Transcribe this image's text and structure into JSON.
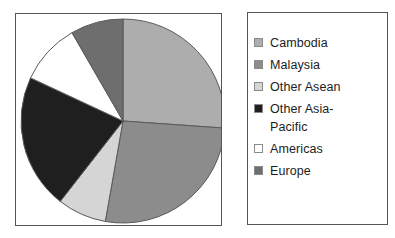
{
  "chart_data": {
    "type": "pie",
    "title": "",
    "subtitle": "",
    "xlabel": "",
    "ylabel": "",
    "grid": false,
    "legend_position": "right",
    "start_angle_deg": 0,
    "direction": "clockwise",
    "categories": [
      "Cambodia",
      "Malaysia",
      "Other Asean",
      "Other Asia-Pacific",
      "Americas",
      "Europe"
    ],
    "values": [
      26,
      27,
      8,
      21,
      10,
      8
    ],
    "slices": [
      {
        "label": "Cambodia",
        "value": 26,
        "percent": 26,
        "color": "#adadad",
        "start_angle_deg": 0,
        "end_angle_deg": 94
      },
      {
        "label": "Malaysia",
        "value": 27,
        "percent": 27,
        "color": "#8c8c8c",
        "start_angle_deg": 94,
        "end_angle_deg": 190
      },
      {
        "label": "Other Asean",
        "value": 8,
        "percent": 8,
        "color": "#d5d5d5",
        "start_angle_deg": 190,
        "end_angle_deg": 218
      },
      {
        "label": "Other Asia-Pacific",
        "value": 21,
        "percent": 21,
        "color": "#1f1f1f",
        "start_angle_deg": 218,
        "end_angle_deg": 295
      },
      {
        "label": "Americas",
        "value": 10,
        "percent": 10,
        "color": "#ffffff",
        "start_angle_deg": 295,
        "end_angle_deg": 330
      },
      {
        "label": "Europe",
        "value": 8,
        "percent": 8,
        "color": "#6e6e6e",
        "start_angle_deg": 330,
        "end_angle_deg": 360
      }
    ]
  },
  "pie_panel": {
    "center_x": 107,
    "center_y": 107,
    "radius": 102,
    "border_color": "#555555",
    "background": "#ffffff",
    "slice_edge_color": "#5a5a5a"
  },
  "legend": {
    "border_color": "#555555",
    "background": "#ffffff",
    "items": [
      {
        "label": "Cambodia",
        "color": "#adadad",
        "swatch_name": "legend-swatch-cambodia"
      },
      {
        "label": "Malaysia",
        "color": "#8c8c8c",
        "swatch_name": "legend-swatch-malaysia"
      },
      {
        "label": "Other Asean",
        "color": "#d5d5d5",
        "swatch_name": "legend-swatch-other-asean"
      },
      {
        "label": "Other Asia-\nPacific",
        "color": "#1f1f1f",
        "swatch_name": "legend-swatch-other-asia-pacific"
      },
      {
        "label": "Americas",
        "color": "#ffffff",
        "swatch_name": "legend-swatch-americas"
      },
      {
        "label": "Europe",
        "color": "#6e6e6e",
        "swatch_name": "legend-swatch-europe"
      }
    ]
  }
}
